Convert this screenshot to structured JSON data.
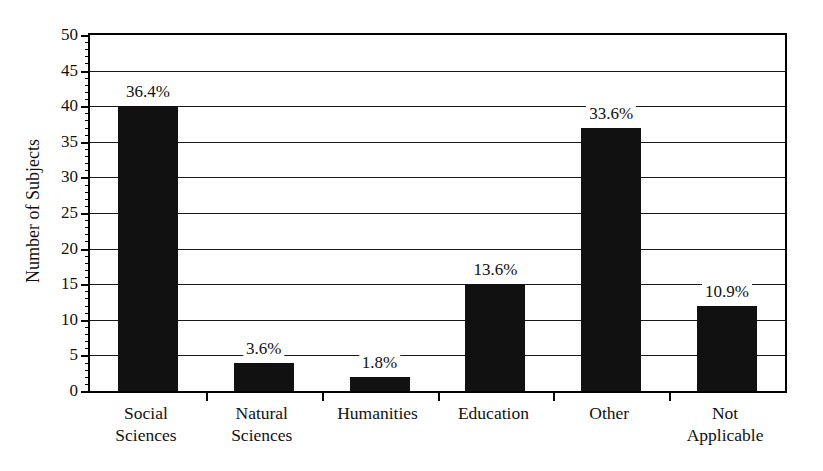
{
  "chart_data": {
    "type": "bar",
    "title": "",
    "xlabel": "",
    "ylabel": "Number of Subjects",
    "ylim": [
      0,
      50
    ],
    "ytick_step": 5,
    "yminor_step": 1,
    "grid": true,
    "legend": "none",
    "categories": [
      "Social Sciences",
      "Natural Sciences",
      "Humanities",
      "Education",
      "Other",
      "Not Applicable"
    ],
    "category_lines": [
      [
        "Social",
        "Sciences"
      ],
      [
        "Natural",
        "Sciences"
      ],
      [
        "Humanities",
        ""
      ],
      [
        "Education",
        ""
      ],
      [
        "Other",
        ""
      ],
      [
        "Not",
        "Applicable"
      ]
    ],
    "values": [
      40,
      4,
      2,
      15,
      37,
      12
    ],
    "data_labels": [
      "36.4%",
      "3.6%",
      "1.8%",
      "13.6%",
      "33.6%",
      "10.9%"
    ],
    "ytick_labels": [
      "0",
      "5",
      "10",
      "15",
      "20",
      "25",
      "30",
      "35",
      "40",
      "45",
      "50"
    ],
    "ytick_values": [
      0,
      5,
      10,
      15,
      20,
      25,
      30,
      35,
      40,
      45,
      50
    ],
    "bar_color": "#111111",
    "axis_color": "#000000",
    "background_color": "#ffffff"
  }
}
